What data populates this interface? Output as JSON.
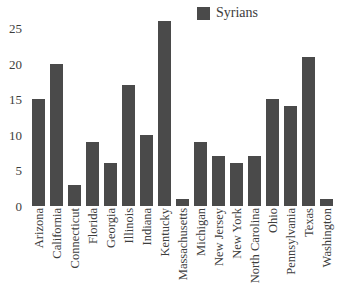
{
  "chart_data": {
    "type": "bar",
    "title": "",
    "xlabel": "",
    "ylabel": "",
    "ylim": [
      0,
      27
    ],
    "yticks": [
      0,
      5,
      10,
      15,
      20,
      25
    ],
    "grid": false,
    "legend_position": "top-center",
    "series_name": "Syrians",
    "bar_color": "#4a4a4a",
    "categories": [
      "Arizona",
      "California",
      "Connecticut",
      "Florida",
      "Georgia",
      "Illinois",
      "Indiana",
      "Kentucky",
      "Massachusetts",
      "Michigan",
      "New Jersey",
      "New York",
      "North Carolina",
      "Ohio",
      "Pennsylvania",
      "Texas",
      "Washington"
    ],
    "values": [
      15,
      20,
      3,
      9,
      6,
      17,
      10,
      26,
      1,
      9,
      7,
      6,
      7,
      15,
      14,
      21,
      1
    ],
    "series": [
      {
        "name": "Syrians",
        "values": [
          15,
          20,
          3,
          9,
          6,
          17,
          10,
          26,
          1,
          9,
          7,
          6,
          7,
          15,
          14,
          21,
          1
        ]
      }
    ]
  },
  "legend": {
    "items": [
      {
        "label": "Syrians",
        "color": "#4a4a4a"
      }
    ]
  },
  "axis": {
    "y_ticks": [
      "0",
      "5",
      "10",
      "15",
      "20",
      "25"
    ]
  },
  "title_remnant": ""
}
